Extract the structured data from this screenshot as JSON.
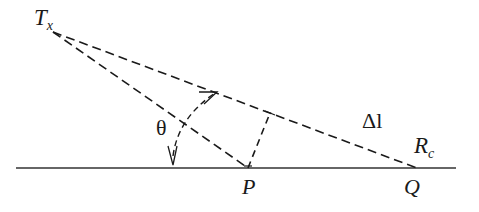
{
  "diagram": {
    "type": "geometry",
    "stroke_color": "#1a1a1a",
    "labels": {
      "transmitter": {
        "main": "T",
        "sub": "x"
      },
      "angle": "θ",
      "path_difference": "Δl",
      "receiver": {
        "main": "R",
        "sub": "c"
      },
      "point_p": "P",
      "point_q": "Q"
    },
    "points": {
      "Tx": [
        53,
        32
      ],
      "P": [
        248,
        168
      ],
      "Q": [
        417,
        168
      ],
      "foot": [
        270,
        113
      ]
    },
    "ground_line": {
      "x1": 16,
      "x2": 456,
      "y": 168
    }
  }
}
